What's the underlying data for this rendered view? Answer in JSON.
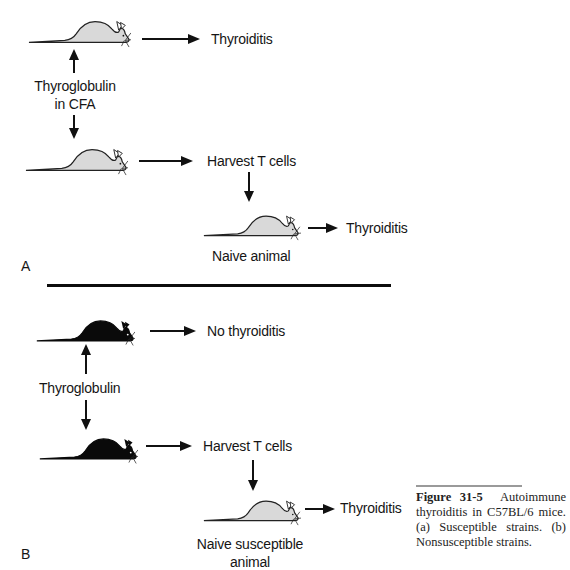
{
  "figure": {
    "panel_a": {
      "letter": "A",
      "mouse1_outcome": "Thyroiditis",
      "immunization": [
        "Thyroglobulin",
        "in CFA"
      ],
      "harvest": "Harvest T cells",
      "recipient_outcome": "Thyroiditis",
      "recipient_label": "Naive animal",
      "mouse_fill": "#d9d9d9"
    },
    "panel_b": {
      "letter": "B",
      "mouse1_outcome": "No thyroiditis",
      "immunization": "Thyroglobulin",
      "harvest": "Harvest T cells",
      "recipient_outcome": "Thyroiditis",
      "recipient_label": [
        "Naive susceptible",
        "animal"
      ],
      "mouse_fill": "#0a0a0a"
    },
    "caption": {
      "label": "Figure 31-5",
      "text_1": "Autoimmune thyroiditis in C57BL/6 mice.",
      "text_2": "(a) Susceptible strains. (b) Nonsusceptible strains."
    }
  }
}
